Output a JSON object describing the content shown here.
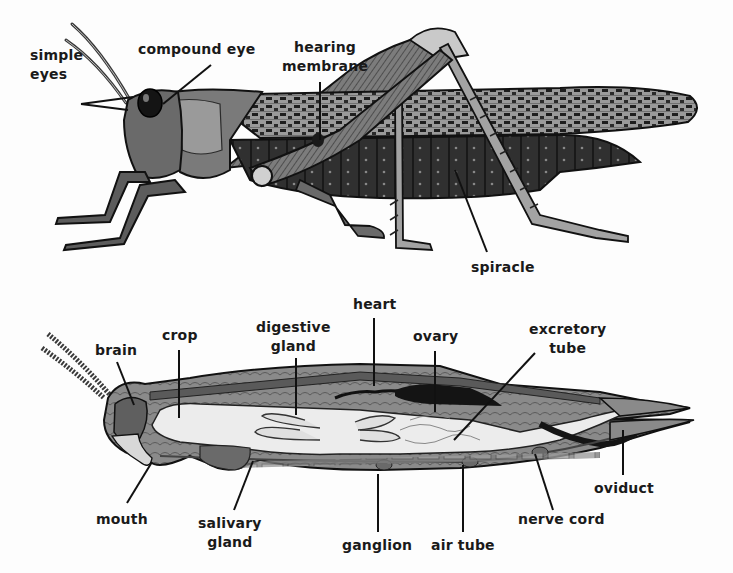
{
  "figure": {
    "colors": {
      "ink": "#1a1a1a",
      "dark": "#2b2b2b",
      "mid": "#6e6e6e",
      "light": "#a8a8a8",
      "pale": "#e6e6e6",
      "background": "#fdfdfd"
    },
    "external_view": {
      "title": "external",
      "labels": [
        {
          "id": "simple-eyes",
          "text": "simple\neyes"
        },
        {
          "id": "compound-eye",
          "text": "compound eye"
        },
        {
          "id": "hearing-membrane",
          "text": "hearing\nmembrane"
        },
        {
          "id": "spiracle",
          "text": "spiracle"
        }
      ]
    },
    "internal_view": {
      "title": "internal",
      "labels": [
        {
          "id": "brain",
          "text": "brain"
        },
        {
          "id": "crop",
          "text": "crop"
        },
        {
          "id": "digestive-gland",
          "text": "digestive\ngland"
        },
        {
          "id": "heart",
          "text": "heart"
        },
        {
          "id": "ovary",
          "text": "ovary"
        },
        {
          "id": "excretory-tube",
          "text": "excretory\ntube"
        },
        {
          "id": "mouth",
          "text": "mouth"
        },
        {
          "id": "salivary-gland",
          "text": "salivary\ngland"
        },
        {
          "id": "ganglion",
          "text": "ganglion"
        },
        {
          "id": "air-tube",
          "text": "air tube"
        },
        {
          "id": "nerve-cord",
          "text": "nerve cord"
        },
        {
          "id": "oviduct",
          "text": "oviduct"
        }
      ]
    }
  }
}
